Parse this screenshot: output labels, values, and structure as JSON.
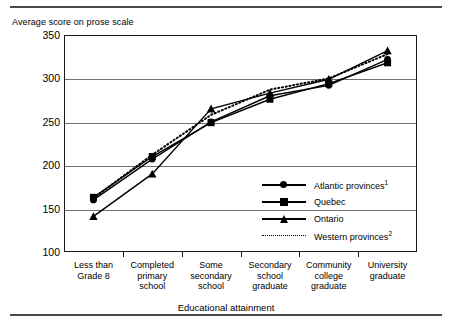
{
  "chart_data": {
    "type": "line",
    "title": "",
    "ylabel": "Average score on prose scale",
    "xlabel": "Educational attainment",
    "ylim": [
      100,
      350
    ],
    "yticks": [
      100,
      150,
      200,
      250,
      300,
      350
    ],
    "grid": true,
    "legend_position": "inside-right",
    "categories": [
      "Less than Grade 8",
      "Completed primary school",
      "Some secondary school",
      "Secondary school graduate",
      "Community college graduate",
      "University graduate"
    ],
    "category_lines": [
      [
        "Less than",
        "Grade 8"
      ],
      [
        "Completed",
        "primary",
        "school"
      ],
      [
        "Some",
        "secondary",
        "school"
      ],
      [
        "Secondary",
        "school",
        "graduate"
      ],
      [
        "Community",
        "college",
        "graduate"
      ],
      [
        "University",
        "graduate"
      ]
    ],
    "series": [
      {
        "name": "Atlantic provinces",
        "footnote": "1",
        "marker": "circle",
        "style": "solid",
        "values": [
          160,
          207,
          250,
          280,
          292,
          322
        ]
      },
      {
        "name": "Quebec",
        "footnote": "",
        "marker": "square",
        "style": "solid",
        "values": [
          163,
          210,
          249,
          276,
          294,
          318
        ]
      },
      {
        "name": "Ontario",
        "footnote": "",
        "marker": "triangle",
        "style": "solid",
        "values": [
          141,
          190,
          265,
          283,
          299,
          332
        ]
      },
      {
        "name": "Western provinces",
        "footnote": "2",
        "marker": "none",
        "style": "dotted",
        "values": [
          162,
          212,
          258,
          287,
          300,
          328
        ]
      }
    ]
  },
  "ytick_labels": [
    "350",
    "300",
    "250",
    "200",
    "150",
    "100"
  ],
  "legend": {
    "items": [
      {
        "label": "Atlantic provinces",
        "sup": "1"
      },
      {
        "label": "Quebec",
        "sup": ""
      },
      {
        "label": "Ontario",
        "sup": ""
      },
      {
        "label": "Western provinces",
        "sup": "2"
      }
    ]
  },
  "colors": {
    "ink": "#000000",
    "grid": "#6f6f6f",
    "frame": "#1a1a1a",
    "rule": "#4a4a4a"
  }
}
